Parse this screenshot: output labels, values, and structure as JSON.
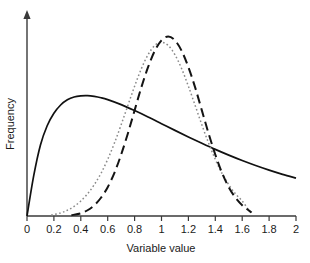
{
  "chart_data": {
    "type": "line",
    "title": "",
    "subtitle": "",
    "xlabel": "Variable value",
    "ylabel": "Frequency",
    "xlim": [
      0,
      2
    ],
    "ylim": [
      0,
      1
    ],
    "grid": false,
    "legend": "none",
    "xticks": [
      "0",
      "0.2",
      "0.4",
      "0.6",
      "0.8",
      "1",
      "1.2",
      "1.4",
      "1.6",
      "1.8",
      "2"
    ],
    "xtick_values": [
      0,
      0.2,
      0.4,
      0.6,
      0.8,
      1,
      1.2,
      1.4,
      1.6,
      1.8,
      2
    ],
    "yticks": [],
    "ytick_labels": [],
    "axis_color": "#3a3a3a",
    "series": [
      {
        "name": "broad-skewed-distribution",
        "style": "solid",
        "color": "#111111",
        "x": [
          0.0,
          0.05,
          0.1,
          0.15,
          0.2,
          0.25,
          0.3,
          0.35,
          0.4,
          0.45,
          0.5,
          0.55,
          0.6,
          0.7,
          0.8,
          0.9,
          1.0,
          1.1,
          1.2,
          1.3,
          1.4,
          1.5,
          1.6,
          1.7,
          1.8,
          1.9,
          2.0
        ],
        "values": [
          0.0,
          0.21,
          0.37,
          0.47,
          0.535,
          0.578,
          0.605,
          0.62,
          0.626,
          0.627,
          0.623,
          0.616,
          0.606,
          0.58,
          0.549,
          0.516,
          0.481,
          0.446,
          0.412,
          0.379,
          0.347,
          0.317,
          0.289,
          0.263,
          0.239,
          0.217,
          0.197
        ]
      },
      {
        "name": "narrow-peaked-distribution-dotted",
        "style": "dotted",
        "color": "#8a8a8a",
        "x": [
          0.18,
          0.25,
          0.3,
          0.35,
          0.4,
          0.45,
          0.5,
          0.55,
          0.6,
          0.65,
          0.7,
          0.75,
          0.8,
          0.85,
          0.9,
          0.95,
          1.0,
          1.05,
          1.1,
          1.15,
          1.2,
          1.25,
          1.3,
          1.35,
          1.4,
          1.45,
          1.5,
          1.55,
          1.6,
          1.65
        ],
        "values": [
          0.005,
          0.016,
          0.03,
          0.05,
          0.078,
          0.115,
          0.163,
          0.222,
          0.295,
          0.38,
          0.475,
          0.576,
          0.676,
          0.767,
          0.84,
          0.888,
          0.905,
          0.888,
          0.84,
          0.767,
          0.676,
          0.576,
          0.475,
          0.38,
          0.295,
          0.222,
          0.163,
          0.115,
          0.078,
          0.03
        ]
      },
      {
        "name": "narrow-peaked-distribution-dashed",
        "style": "dashed",
        "color": "#141414",
        "x": [
          0.33,
          0.4,
          0.45,
          0.5,
          0.55,
          0.6,
          0.65,
          0.7,
          0.75,
          0.8,
          0.85,
          0.9,
          0.95,
          1.0,
          1.05,
          1.1,
          1.15,
          1.2,
          1.25,
          1.3,
          1.35,
          1.4,
          1.45,
          1.5,
          1.55,
          1.6,
          1.67
        ],
        "values": [
          0.004,
          0.014,
          0.03,
          0.056,
          0.095,
          0.15,
          0.225,
          0.32,
          0.43,
          0.55,
          0.67,
          0.775,
          0.86,
          0.915,
          0.935,
          0.915,
          0.86,
          0.775,
          0.67,
          0.55,
          0.43,
          0.32,
          0.225,
          0.15,
          0.095,
          0.056,
          0.018
        ]
      }
    ],
    "annotations": []
  }
}
